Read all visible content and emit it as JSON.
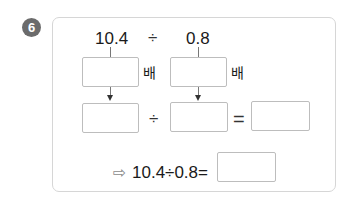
{
  "problem": {
    "number": "6",
    "dividend": "10.4",
    "divisor": "0.8",
    "division_sign": "÷",
    "equals_sign": "=",
    "times_label_1": "배",
    "times_label_2": "배",
    "conclusion_arrow": "⇨",
    "conclusion_expression": "10.4÷0.8=",
    "blanks": {
      "multiplier_1": "",
      "multiplier_2": "",
      "new_dividend": "",
      "new_divisor": "",
      "quotient": "",
      "final_answer": ""
    }
  }
}
